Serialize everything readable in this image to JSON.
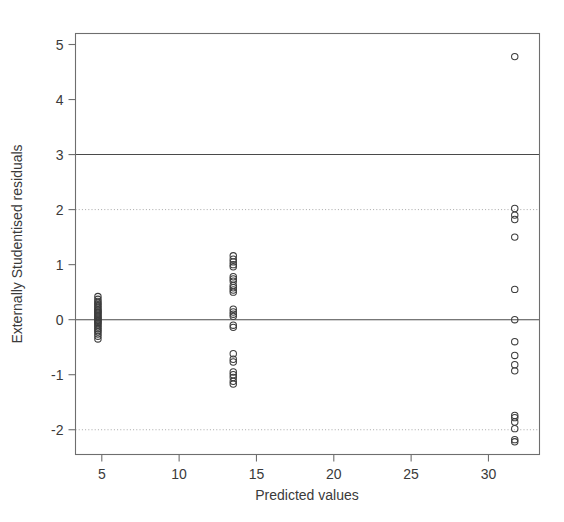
{
  "chart_data": {
    "type": "scatter",
    "title": "",
    "xlabel": "Predicted values",
    "ylabel": "Externally Studentised residuals",
    "xlim": [
      3.3,
      33.3
    ],
    "ylim": [
      -2.45,
      5.2
    ],
    "xticks": [
      5,
      10,
      15,
      20,
      25,
      30
    ],
    "xticklabels": [
      "5",
      "10",
      "15",
      "20",
      "25",
      "30"
    ],
    "yticks": [
      5,
      4,
      3,
      2,
      1,
      0,
      -1,
      -2
    ],
    "yticklabels": [
      "5",
      "4",
      "3",
      "2",
      "1",
      "0",
      "-1",
      "-2"
    ],
    "grid": false,
    "legend": null,
    "point_marker": "open-circle",
    "point_radius_px": 3.2,
    "reference_lines": [
      {
        "name": "upper-solid-3",
        "y": 3,
        "style": "solid",
        "color": "#4a4a4a"
      },
      {
        "name": "upper-dotted-2",
        "y": 2,
        "style": "dotted",
        "color": "#a8a8a8"
      },
      {
        "name": "zero-solid",
        "y": 0,
        "style": "solid",
        "color": "#4a4a4a"
      },
      {
        "name": "lower-dotted-neg2",
        "y": -2,
        "style": "dotted",
        "color": "#a8a8a8"
      }
    ],
    "series": [
      {
        "name": "residuals",
        "x": [
          4.75,
          4.75,
          4.75,
          4.75,
          4.75,
          4.75,
          4.75,
          4.75,
          4.75,
          4.75,
          4.75,
          4.75,
          4.75,
          4.75,
          4.75,
          4.75,
          4.75,
          4.75,
          4.75,
          4.75,
          4.75,
          4.75,
          4.75,
          4.75,
          4.75,
          4.75,
          4.75,
          4.75,
          13.5,
          13.5,
          13.5,
          13.5,
          13.5,
          13.5,
          13.5,
          13.5,
          13.5,
          13.5,
          13.5,
          13.5,
          13.5,
          13.5,
          13.5,
          13.5,
          13.5,
          13.5,
          13.5,
          13.5,
          13.5,
          13.5,
          13.5,
          13.5,
          13.5,
          13.5,
          31.7,
          31.7,
          31.7,
          31.7,
          31.7,
          31.7,
          31.7,
          31.7,
          31.7,
          31.7,
          31.7,
          31.7,
          31.7,
          31.7,
          31.7,
          31.7,
          31.7
        ],
        "y": [
          0.42,
          0.37,
          0.33,
          0.3,
          0.27,
          0.24,
          0.21,
          0.18,
          0.16,
          0.14,
          0.12,
          0.1,
          0.07,
          0.05,
          0.03,
          0.01,
          -0.01,
          -0.03,
          -0.05,
          -0.07,
          -0.1,
          -0.13,
          -0.16,
          -0.19,
          -0.22,
          -0.26,
          -0.3,
          -0.35,
          1.16,
          1.1,
          1.05,
          1.0,
          0.96,
          0.78,
          0.74,
          0.7,
          0.62,
          0.58,
          0.54,
          0.5,
          0.19,
          0.14,
          0.1,
          0.06,
          -0.1,
          -0.14,
          -0.62,
          -0.72,
          -0.77,
          -0.95,
          -1.0,
          -1.05,
          -1.12,
          -1.17,
          4.78,
          2.02,
          1.9,
          1.82,
          1.5,
          0.55,
          0.0,
          -0.4,
          -0.65,
          -0.82,
          -0.93,
          -1.74,
          -1.78,
          -1.86,
          -1.98,
          -2.18,
          -2.22
        ]
      }
    ]
  },
  "axis": {
    "x_title": "Predicted values",
    "y_title": "Externally Studentised residuals"
  }
}
